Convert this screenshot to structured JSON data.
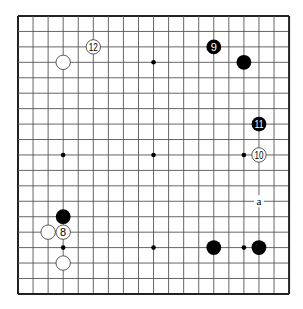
{
  "board": {
    "size": 19,
    "origin_x": 18,
    "origin_y": 16,
    "step_x": 15.06,
    "step_y": 15.44,
    "line_color": "#555555",
    "border_color": "#222222",
    "star_points": [
      [
        3,
        3
      ],
      [
        9,
        3
      ],
      [
        15,
        3
      ],
      [
        3,
        9
      ],
      [
        9,
        9
      ],
      [
        15,
        9
      ],
      [
        3,
        15
      ],
      [
        9,
        15
      ],
      [
        15,
        15
      ]
    ]
  },
  "stones": [
    {
      "color": "white",
      "col": 3,
      "row": 3,
      "label": ""
    },
    {
      "color": "white",
      "col": 5,
      "row": 2,
      "label": "12"
    },
    {
      "color": "black",
      "col": 13,
      "row": 2,
      "label": "9"
    },
    {
      "color": "black",
      "col": 15,
      "row": 3,
      "label": ""
    },
    {
      "color": "black",
      "col": 16,
      "row": 7,
      "label": "11"
    },
    {
      "color": "white",
      "col": 16,
      "row": 9,
      "label": "10"
    },
    {
      "color": "black",
      "col": 3,
      "row": 13,
      "label": ""
    },
    {
      "color": "white",
      "col": 2,
      "row": 14,
      "label": ""
    },
    {
      "color": "white",
      "col": 3,
      "row": 14,
      "label": "8"
    },
    {
      "color": "white",
      "col": 3,
      "row": 16,
      "label": ""
    },
    {
      "color": "black",
      "col": 13,
      "row": 15,
      "label": ""
    },
    {
      "color": "black",
      "col": 16,
      "row": 15,
      "label": ""
    }
  ],
  "markers": [
    {
      "col": 16,
      "row": 12,
      "label": "a"
    }
  ]
}
